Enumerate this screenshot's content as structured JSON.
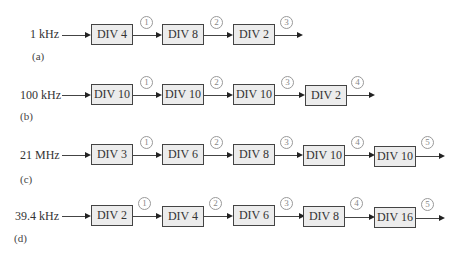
{
  "figure": {
    "rows": [
      {
        "id": "a",
        "label": "(a)",
        "input": "1 kHz",
        "stages": [
          "DIV 4",
          "DIV 8",
          "DIV 2"
        ],
        "nodes": [
          "1",
          "2",
          "3"
        ]
      },
      {
        "id": "b",
        "label": "(b)",
        "input": "100 kHz",
        "stages": [
          "DIV 10",
          "DIV 10",
          "DIV 10",
          "DIV 2"
        ],
        "nodes": [
          "1",
          "2",
          "3",
          "4"
        ]
      },
      {
        "id": "c",
        "label": "(c)",
        "input": "21 MHz",
        "stages": [
          "DIV 3",
          "DIV 6",
          "DIV 8",
          "DIV 10",
          "DIV 10"
        ],
        "nodes": [
          "1",
          "2",
          "3",
          "4",
          "5"
        ]
      },
      {
        "id": "d",
        "label": "(d)",
        "input": "39.4 kHz",
        "stages": [
          "DIV 2",
          "DIV 4",
          "DIV 6",
          "DIV 8",
          "DIV 16"
        ],
        "nodes": [
          "1",
          "2",
          "3",
          "4",
          "5"
        ]
      }
    ],
    "colors": {
      "box_fill": "#ececec",
      "box_border": "#444444",
      "wire": "#444444",
      "node_outline": "#999999"
    }
  }
}
